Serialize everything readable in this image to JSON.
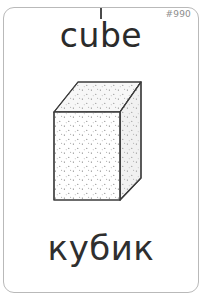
{
  "card": {
    "id_label": "#990",
    "word_en": "cube",
    "word_ru": "кубик",
    "illustration_name": "cube-3d-illustration",
    "colors": {
      "border": "#b9b9b9",
      "text_primary": "#2b2b2b",
      "text_secondary": "#2f2f2f",
      "id_text": "#8d8d8d",
      "cut_tick": "#4a4a4a",
      "background": "#ffffff",
      "line_art": "#3c3c3c",
      "shade_top": "#f4f4f4",
      "shade_right": "#ededed",
      "stipple": "#6f6f6f"
    },
    "illustration_parts": {
      "top_face": "top-face",
      "front_face": "front-face",
      "right_face": "right-face"
    }
  }
}
